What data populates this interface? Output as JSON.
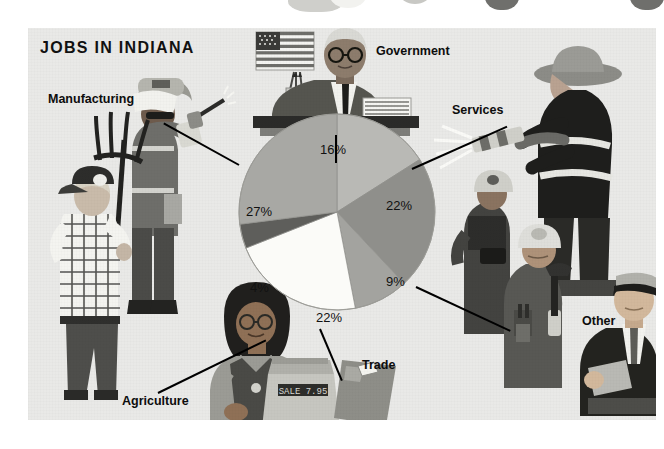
{
  "poster": {
    "title": "JOBS IN INDIANA",
    "background_color": "#e9e9e7",
    "page_color": "#ffffff"
  },
  "labels": {
    "manufacturing": "Manufacturing",
    "government": "Government",
    "services": "Services",
    "other": "Other",
    "trade": "Trade",
    "agriculture": "Agriculture"
  },
  "percent_labels": {
    "government": "16%",
    "services": "22%",
    "other": "9%",
    "trade": "22%",
    "agriculture": "4%",
    "manufacturing": "27%"
  },
  "illustration": {
    "cash_register_display": "SALE 7.95"
  },
  "chart_data": {
    "type": "pie",
    "title": "JOBS IN INDIANA",
    "categories": [
      "Government",
      "Services",
      "Other",
      "Trade",
      "Agriculture",
      "Manufacturing"
    ],
    "values": [
      16,
      22,
      9,
      22,
      4,
      27
    ],
    "value_labels": [
      "16%",
      "22%",
      "9%",
      "22%",
      "4%",
      "27%"
    ],
    "unit": "percent",
    "colors": [
      "#b9b9b5",
      "#8f8f8b",
      "#a3a39f",
      "#fbfbf8",
      "#5e5e5b",
      "#a8a8a4"
    ],
    "legend": "labels placed around the pie with leader lines",
    "grid": false
  }
}
